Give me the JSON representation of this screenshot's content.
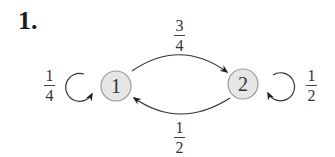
{
  "problem": {
    "number": "1."
  },
  "diagram": {
    "type": "markov-chain-state-diagram",
    "nodes": [
      {
        "id": "1",
        "label": "1",
        "fill": "#e6e6e6",
        "stroke": "#999999"
      },
      {
        "id": "2",
        "label": "2",
        "fill": "#e6e6e6",
        "stroke": "#999999"
      }
    ],
    "edges": [
      {
        "from": "1",
        "to": "1",
        "prob_num": "1",
        "prob_den": "4"
      },
      {
        "from": "1",
        "to": "2",
        "prob_num": "3",
        "prob_den": "4"
      },
      {
        "from": "2",
        "to": "1",
        "prob_num": "1",
        "prob_den": "2"
      },
      {
        "from": "2",
        "to": "2",
        "prob_num": "1",
        "prob_den": "2"
      }
    ],
    "line_color": "#333333"
  }
}
